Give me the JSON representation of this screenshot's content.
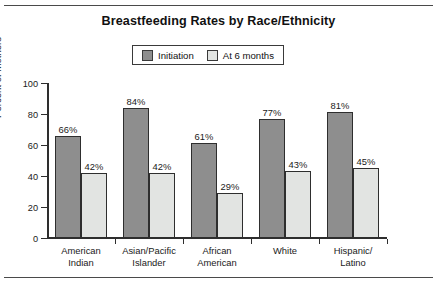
{
  "chart_data": {
    "type": "bar",
    "title": "Breastfeeding Rates by Race/Ethnicity",
    "xlabel": "",
    "ylabel": "Percent of Mothers",
    "ylim": [
      0,
      100
    ],
    "yticks": [
      0,
      20,
      40,
      60,
      80,
      100
    ],
    "grid": false,
    "legend_position": "top-center",
    "categories": [
      "American\nIndian",
      "Asian/Pacific\nIslander",
      "African\nAmerican",
      "White",
      "Hispanic/\nLatino"
    ],
    "series": [
      {
        "name": "Initiation",
        "color": "#8e8e8e",
        "values": [
          66,
          84,
          61,
          77,
          81
        ],
        "labels": [
          "66%",
          "84%",
          "61%",
          "77%",
          "81%"
        ]
      },
      {
        "name": "At 6 months",
        "color": "#e2e4e2",
        "values": [
          42,
          42,
          29,
          43,
          45
        ],
        "labels": [
          "42%",
          "42%",
          "29%",
          "43%",
          "45%"
        ]
      }
    ]
  },
  "legend": {
    "items": [
      {
        "label": "Initiation",
        "swatch": "dark"
      },
      {
        "label": "At 6 months",
        "swatch": "light"
      }
    ]
  },
  "colors": {
    "initiation": "#8e8e8e",
    "six_months": "#e2e4e2",
    "axis": "#2e2e2e",
    "rule": "#4a4a4a",
    "background": "#ffffff"
  }
}
